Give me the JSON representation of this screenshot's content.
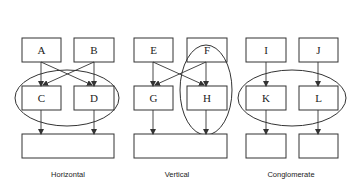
{
  "diagram": {
    "panels": [
      {
        "caption": "Horizontal",
        "top_boxes": [
          "A",
          "B"
        ],
        "mid_boxes": [
          "C",
          "D"
        ],
        "bottom": "single wide box",
        "grouping": "ellipse around C and D (horizontal)",
        "arrows": [
          "A->C",
          "A->D",
          "B->C",
          "B->D",
          "C->bottom",
          "D->bottom"
        ]
      },
      {
        "caption": "Vertical",
        "top_boxes": [
          "E",
          "F"
        ],
        "mid_boxes": [
          "G",
          "H"
        ],
        "bottom": "single wide box",
        "grouping": "vertical ellipse around F and H",
        "arrows": [
          "E->G",
          "E->H",
          "F->G",
          "F->H",
          "G->bottom",
          "H->bottom"
        ]
      },
      {
        "caption": "Conglomerate",
        "top_boxes": [
          "I",
          "J"
        ],
        "mid_boxes": [
          "K",
          "L"
        ],
        "bottom": "two separate boxes",
        "grouping": "ellipse around K and L",
        "arrows": [
          "I->K",
          "J->L",
          "K->bottom-left",
          "L->bottom-right"
        ]
      }
    ]
  }
}
